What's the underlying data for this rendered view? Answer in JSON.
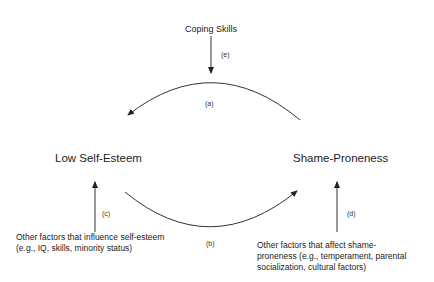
{
  "nodes": {
    "coping": "Coping Skills",
    "low_self_esteem": "Low Self-Esteem",
    "shame_proneness": "Shame-Proneness"
  },
  "labels": {
    "a": "(a)",
    "b": "(b)",
    "c": "(c)",
    "d": "(d)",
    "e": "(e)"
  },
  "notes": {
    "self_esteem_line1": "Other factors that influence self-esteem",
    "self_esteem_line2": "(e.g., IQ, skills, minority status)",
    "shame_line1": "Other factors that affect shame-",
    "shame_line2": "proneness (e.g., temperament, parental",
    "shame_line3": "socialization, cultural factors)"
  },
  "edges": [
    {
      "id": "a",
      "from": "Shame-Proneness",
      "to": "Low Self-Esteem"
    },
    {
      "id": "b",
      "from": "Low Self-Esteem",
      "to": "Shame-Proneness"
    },
    {
      "id": "c",
      "from": "Other factors that influence self-esteem",
      "to": "Low Self-Esteem"
    },
    {
      "id": "d",
      "from": "Other factors that affect shame-proneness",
      "to": "Shame-Proneness"
    },
    {
      "id": "e",
      "from": "Coping Skills",
      "to": "arc (a)"
    }
  ],
  "colors": {
    "line": "#333333",
    "text": "#222222"
  }
}
